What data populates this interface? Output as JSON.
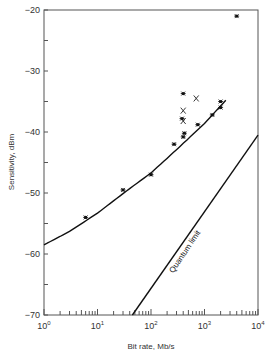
{
  "chart_data": {
    "type": "scatter",
    "title": "",
    "xlabel": "Bit rate, Mb/s",
    "ylabel": "Sensitivity, dBm",
    "xscale": "log",
    "xlim": [
      1,
      10000
    ],
    "ylim": [
      -70,
      -20
    ],
    "x_tick_labels": [
      "10^0",
      "10^1",
      "10^2",
      "10^3",
      "10^4"
    ],
    "y_tick_labels": [
      "-20",
      "-30",
      "-40",
      "-50",
      "-60",
      "-70"
    ],
    "grid": false,
    "legend": null,
    "annotations": [
      {
        "text": "Quantum limit",
        "along": "quantum-limit-line"
      }
    ],
    "series": [
      {
        "name": "Measured (asterisk markers)",
        "marker": "asterisk",
        "points": [
          {
            "x": 6,
            "y": -54
          },
          {
            "x": 30,
            "y": -49.5
          },
          {
            "x": 100,
            "y": -47
          },
          {
            "x": 270,
            "y": -42
          },
          {
            "x": 380,
            "y": -37.8
          },
          {
            "x": 400,
            "y": -33.7
          },
          {
            "x": 400,
            "y": -40.8
          },
          {
            "x": 420,
            "y": -40.2
          },
          {
            "x": 750,
            "y": -38.8
          },
          {
            "x": 1400,
            "y": -37.2
          },
          {
            "x": 2000,
            "y": -36
          },
          {
            "x": 2000,
            "y": -35
          },
          {
            "x": 4000,
            "y": -21
          }
        ]
      },
      {
        "name": "Measured (x markers)",
        "marker": "x",
        "points": [
          {
            "x": 400,
            "y": -36.5
          },
          {
            "x": 400,
            "y": -38.2
          },
          {
            "x": 700,
            "y": -34.5
          }
        ]
      },
      {
        "name": "Fitted curve",
        "type": "line",
        "points": [
          {
            "x": 1,
            "y": -58.5
          },
          {
            "x": 3,
            "y": -56.3
          },
          {
            "x": 10,
            "y": -53.3
          },
          {
            "x": 30,
            "y": -50.1
          },
          {
            "x": 100,
            "y": -46.7
          },
          {
            "x": 300,
            "y": -42.9
          },
          {
            "x": 1000,
            "y": -38.6
          },
          {
            "x": 2500,
            "y": -34.8
          }
        ]
      },
      {
        "name": "Quantum limit",
        "type": "line",
        "points": [
          {
            "x": 45,
            "y": -70
          },
          {
            "x": 10000,
            "y": -40.5
          }
        ]
      }
    ]
  }
}
